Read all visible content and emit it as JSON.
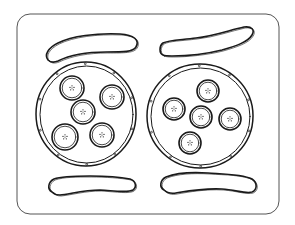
{
  "illustration": {
    "subject": "breakfast tray coloring page",
    "style": "black line art on white",
    "colors": {
      "background": "#ffffff",
      "line": "#1a1a1a",
      "tray_line": "#555555"
    },
    "tray": {
      "x": 17,
      "y": 14,
      "width": 262,
      "height": 200,
      "corner_radius": 13
    },
    "pancakes": [
      {
        "name": "left-pancake",
        "cx": 86,
        "cy": 114,
        "rx": 50,
        "ry": 52,
        "banana_slices": [
          {
            "cx": 72,
            "cy": 88,
            "r": 12
          },
          {
            "cx": 112,
            "cy": 97,
            "r": 12
          },
          {
            "cx": 83,
            "cy": 112,
            "r": 12
          },
          {
            "cx": 65,
            "cy": 137,
            "r": 13
          },
          {
            "cx": 102,
            "cy": 135,
            "r": 12
          }
        ]
      },
      {
        "name": "right-pancake",
        "cx": 200,
        "cy": 116,
        "rx": 53,
        "ry": 52,
        "banana_slices": [
          {
            "cx": 208,
            "cy": 91,
            "r": 11
          },
          {
            "cx": 174,
            "cy": 109,
            "r": 11
          },
          {
            "cx": 201,
            "cy": 117,
            "r": 11
          },
          {
            "cx": 230,
            "cy": 119,
            "r": 11
          },
          {
            "cx": 190,
            "cy": 143,
            "r": 11
          }
        ]
      }
    ],
    "sausages": [
      {
        "name": "top-left-sausage",
        "d": "M48 60 C44 55 48 48 58 43 C72 36 96 33 120 34 C134 35 140 40 136 47 C133 52 124 52 106 52 C88 52 70 55 58 61 C53 63 50 62 48 60 Z"
      },
      {
        "name": "top-right-sausage",
        "d": "M163 55 C159 53 159 46 163 43 C168 40 180 40 196 38 C214 36 230 30 244 27 C252 26 255 30 252 35 C248 42 236 46 222 50 C206 54 186 56 172 56 C168 56 165 56 163 55 Z"
      },
      {
        "name": "bottom-left-sausage",
        "d": "M52 192 C47 189 48 182 54 179 C62 176 76 176 90 176 C104 176 120 177 130 179 C136 181 137 187 133 190 C128 193 116 191 100 190 C84 190 70 194 60 195 C56 195 54 194 52 192 Z"
      },
      {
        "name": "bottom-right-sausage",
        "d": "M164 190 C159 187 160 180 166 177 C176 173 192 172 208 173 C224 174 242 174 252 179 C258 183 257 190 252 192 C246 194 236 190 222 189 C204 188 188 191 176 193 C170 194 167 193 164 190 Z"
      }
    ]
  }
}
